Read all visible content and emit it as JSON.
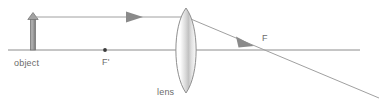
{
  "diagram": {
    "type": "optics-ray-diagram",
    "canvas": {
      "width": 383,
      "height": 103
    },
    "colors": {
      "background": "#ffffff",
      "axis": "#8c8c8c",
      "ray": "#9a9a9a",
      "arrowhead": "#8a8a8a",
      "object": "#9e9e9e",
      "object_edge": "#6f6f6f",
      "lens_stroke": "#8f8f8f",
      "lens_fill_light": "#ffffff",
      "lens_fill_shade": "#bdbdbd",
      "label_text": "#6b6b6b",
      "point_dot": "#3a3a3a"
    },
    "labels": {
      "object": "object",
      "near_focal_point": "F'",
      "lens": "lens",
      "far_focal_point": "F"
    },
    "geometry": {
      "optical_axis": {
        "x1": 8,
        "y1": 50,
        "x2": 360,
        "y2": 50
      },
      "object_arrow": {
        "x": 33,
        "base_y": 50,
        "tip_y": 14,
        "shaft_width": 5
      },
      "near_focal_dot": {
        "cx": 105,
        "cy": 50,
        "r": 1.8
      },
      "lens": {
        "cx": 186,
        "cy": 50,
        "top_y": 8,
        "bottom_y": 93,
        "half_width": 10
      },
      "incident_ray": {
        "x1": 36,
        "y1": 17,
        "x2": 186,
        "y2": 17
      },
      "incident_arrowhead": {
        "x": 126,
        "y": 17
      },
      "refracted_ray": {
        "x1": 186,
        "y1": 17,
        "x2": 378,
        "y2": 97
      },
      "refracted_arrowhead": {
        "x": 243,
        "y": 41
      },
      "axis_crossing": {
        "cx": 263,
        "cy": 50
      }
    },
    "label_positions": {
      "object": {
        "x": 14,
        "y": 66
      },
      "near_focal_point": {
        "x": 102,
        "y": 65
      },
      "lens": {
        "x": 157,
        "y": 94
      },
      "far_focal_point": {
        "x": 262,
        "y": 41
      }
    }
  }
}
